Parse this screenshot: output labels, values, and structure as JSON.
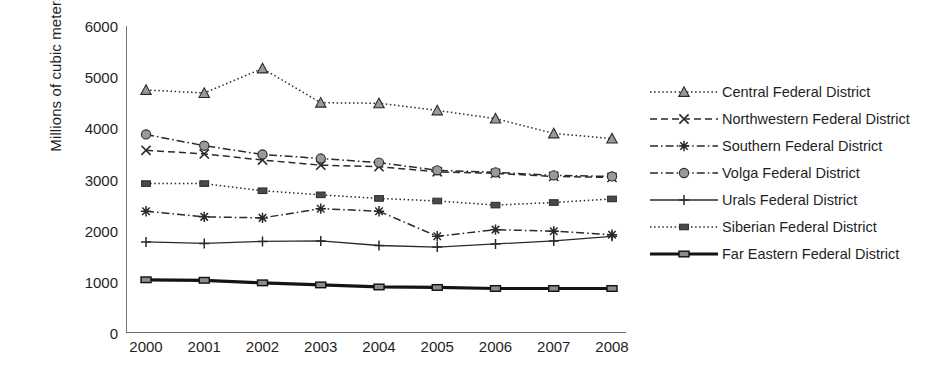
{
  "chart_data": {
    "type": "line",
    "title": "",
    "xlabel": "",
    "ylabel": "Millions of cubic meters",
    "categories": [
      2000,
      2001,
      2002,
      2003,
      2004,
      2005,
      2006,
      2007,
      2008
    ],
    "xtick_labels": [
      "2000",
      "2001",
      "2002",
      "2003",
      "2004",
      "2005",
      "2006",
      "2007",
      "2008"
    ],
    "ytick_labels": [
      "0",
      "1000",
      "2000",
      "3000",
      "4000",
      "5000",
      "6000"
    ],
    "ytick_values": [
      0,
      1000,
      2000,
      3000,
      4000,
      5000,
      6000
    ],
    "ylim": [
      0,
      6000
    ],
    "grid": false,
    "legend_position": "right",
    "series": [
      {
        "name": "Central Federal District",
        "marker": "triangle",
        "line_style": "dotted",
        "values": [
          4750,
          4690,
          5170,
          4500,
          4490,
          4350,
          4190,
          3900,
          3800
        ]
      },
      {
        "name": "Northwestern Federal District",
        "marker": "x",
        "line_style": "dashed",
        "values": [
          3570,
          3500,
          3380,
          3280,
          3250,
          3150,
          3120,
          3060,
          3040
        ]
      },
      {
        "name": "Southern Federal District",
        "marker": "asterisk",
        "line_style": "dash-dot",
        "values": [
          2380,
          2270,
          2250,
          2430,
          2380,
          1890,
          2020,
          1990,
          1920
        ]
      },
      {
        "name": "Volga Federal District",
        "marker": "circle",
        "line_style": "dash-dot",
        "values": [
          3880,
          3660,
          3490,
          3410,
          3330,
          3180,
          3140,
          3080,
          3060
        ]
      },
      {
        "name": "Urals Federal District",
        "marker": "plus",
        "line_style": "solid",
        "values": [
          1780,
          1750,
          1790,
          1800,
          1710,
          1680,
          1740,
          1800,
          1890
        ]
      },
      {
        "name": "Siberian Federal District",
        "marker": "square",
        "line_style": "dotted",
        "values": [
          2920,
          2920,
          2780,
          2700,
          2630,
          2580,
          2500,
          2550,
          2620
        ]
      },
      {
        "name": "Far Eastern Federal District",
        "marker": "square-bold",
        "line_style": "solid-bold",
        "values": [
          1040,
          1030,
          980,
          940,
          900,
          890,
          870,
          870,
          870
        ]
      }
    ]
  },
  "legend": {
    "items": [
      {
        "label": "Central Federal District"
      },
      {
        "label": "Northwestern Federal District"
      },
      {
        "label": "Southern Federal District"
      },
      {
        "label": "Volga Federal District"
      },
      {
        "label": "Urals Federal District"
      },
      {
        "label": "Siberian Federal District"
      },
      {
        "label": "Far Eastern Federal District"
      }
    ]
  }
}
